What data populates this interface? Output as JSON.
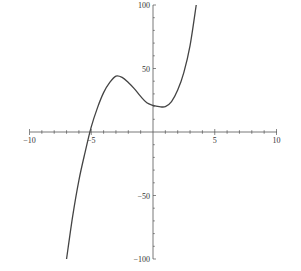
{
  "chart_data": {
    "type": "line",
    "title": "",
    "xlabel": "",
    "ylabel": "",
    "xlim": [
      -10,
      10
    ],
    "ylim": [
      -100,
      100
    ],
    "grid": false,
    "x_ticks": [
      "-10",
      "-5",
      "5",
      "10"
    ],
    "y_ticks": [
      "100",
      "50",
      "-50",
      "-100"
    ],
    "series": [
      {
        "name": "f(x)",
        "x": [
          -7.0,
          -6.5,
          -6.0,
          -5.5,
          -5.0,
          -4.5,
          -4.0,
          -3.5,
          -3.0,
          -2.5,
          -2.0,
          -1.5,
          -1.0,
          -0.5,
          0.0,
          0.5,
          1.0,
          1.5,
          2.0,
          2.5,
          3.0,
          3.5
        ],
        "y": [
          -100,
          -66,
          -38,
          -16,
          4,
          19,
          31,
          39,
          44,
          43,
          39,
          34,
          28,
          23,
          21,
          20,
          20,
          24,
          33,
          47,
          68,
          100
        ]
      }
    ],
    "annotations": {
      "local_max": [
        -3,
        44
      ],
      "local_min": [
        1,
        20
      ],
      "root": -5.2
    }
  },
  "axes": {
    "x_labels": [
      "-10",
      "-5",
      "5",
      "10"
    ],
    "y_labels": [
      "100",
      "50",
      "-50",
      "-100"
    ]
  },
  "colors": {
    "curve": "#444444",
    "axis": "#555555"
  }
}
